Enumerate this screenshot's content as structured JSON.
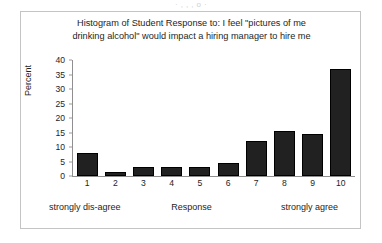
{
  "page": {
    "scan_artifact_text": "· ,  , ,    o ·"
  },
  "chart_data": {
    "type": "bar",
    "title_lines": [
      "Histogram of Student Response to: I feel \"pictures of me",
      "drinking alcohol\" would impact a hiring manager to hire me"
    ],
    "title": "Histogram of Student Response to: I feel \"pictures of me drinking alcohol\" would impact a hiring manager to hire me",
    "categories": [
      "1",
      "2",
      "3",
      "4",
      "5",
      "6",
      "7",
      "8",
      "9",
      "10"
    ],
    "values": [
      8,
      1.5,
      3,
      3,
      3,
      4.5,
      12,
      15.5,
      14.5,
      37
    ],
    "xlabel": "Response",
    "ylabel": "Percent",
    "ylim": [
      0,
      40
    ],
    "ytick_step": 5,
    "yticks": [
      "40",
      "35",
      "30",
      "25",
      "20",
      "15",
      "10",
      "5",
      "0"
    ],
    "grid": false,
    "legend": false,
    "bar_color": "#212121",
    "axis_color": "#8f8f8f",
    "annotations": {
      "left": "strongly dis-agree",
      "center": "Response",
      "right": "strongly agree"
    }
  }
}
